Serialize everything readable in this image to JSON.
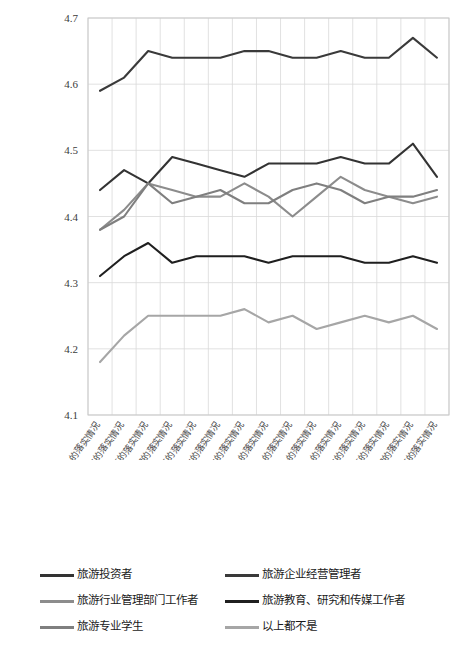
{
  "chart_data": {
    "type": "line",
    "title": "",
    "xlabel": "",
    "ylabel": "",
    "ylim": [
      4.1,
      4.7
    ],
    "yticks": [
      "4.1",
      "4.2",
      "4.3",
      "4.4",
      "4.5",
      "4.6",
      "4.7"
    ],
    "grid": true,
    "legend_position": "bottom",
    "categories": [
      "评价土地政策一的落实情况",
      "评价土地政策二的落实情况",
      "评价土地政策三的落实情况",
      "评价土地政策四的落实情况",
      "评价土地政策五的落实情况",
      "评价土地政策六的落实情况",
      "评价土地政策七的落实情况",
      "评价土地政策八的落实情况",
      "评价土地政策九的落实情况",
      "评价土地政策十的落实情况",
      "评价土地政策十一的落实情况",
      "评价土地政策十二的落实情况",
      "评价土地政策十三的落实情况",
      "评价土地政策十四的落实情况",
      "评价土地政策十五的落实情况"
    ],
    "series": [
      {
        "name": "旅游投资者",
        "color": "#333333",
        "values": [
          4.44,
          4.47,
          4.45,
          4.49,
          4.48,
          4.47,
          4.46,
          4.48,
          4.48,
          4.48,
          4.49,
          4.48,
          4.48,
          4.51,
          4.46
        ]
      },
      {
        "name": "旅游企业经营管理者",
        "color": "#3a3a3a",
        "values": [
          4.59,
          4.61,
          4.65,
          4.64,
          4.64,
          4.64,
          4.65,
          4.65,
          4.64,
          4.64,
          4.65,
          4.64,
          4.64,
          4.67,
          4.64
        ]
      },
      {
        "name": "旅游行业管理部门工作者",
        "color": "#8c8c8c",
        "values": [
          4.38,
          4.41,
          4.45,
          4.44,
          4.43,
          4.43,
          4.45,
          4.43,
          4.4,
          4.43,
          4.46,
          4.44,
          4.43,
          4.42,
          4.43
        ]
      },
      {
        "name": "旅游教育、研究和传媒工作者",
        "color": "#1f1f1f",
        "values": [
          4.31,
          4.34,
          4.36,
          4.33,
          4.34,
          4.34,
          4.34,
          4.33,
          4.34,
          4.34,
          4.34,
          4.33,
          4.33,
          4.34,
          4.33
        ]
      },
      {
        "name": "旅游专业学生",
        "color": "#7f7f7f",
        "values": [
          4.38,
          4.4,
          4.45,
          4.42,
          4.43,
          4.44,
          4.42,
          4.42,
          4.44,
          4.45,
          4.44,
          4.42,
          4.43,
          4.43,
          4.44
        ]
      },
      {
        "name": "以上都不是",
        "color": "#a6a6a6",
        "values": [
          4.18,
          4.22,
          4.25,
          4.25,
          4.25,
          4.25,
          4.26,
          4.24,
          4.25,
          4.23,
          4.24,
          4.25,
          4.24,
          4.25,
          4.23
        ]
      }
    ]
  },
  "legend": {
    "rows": [
      [
        {
          "label": "旅游投资者",
          "color": "#333333"
        },
        {
          "label": "旅游企业经营管理者",
          "color": "#3a3a3a"
        }
      ],
      [
        {
          "label": "旅游行业管理部门工作者",
          "color": "#8c8c8c"
        },
        {
          "label": "旅游教育、研究和传媒工作者",
          "color": "#1f1f1f"
        }
      ],
      [
        {
          "label": "旅游专业学生",
          "color": "#7f7f7f"
        },
        {
          "label": "以上都不是",
          "color": "#a6a6a6"
        }
      ]
    ]
  }
}
